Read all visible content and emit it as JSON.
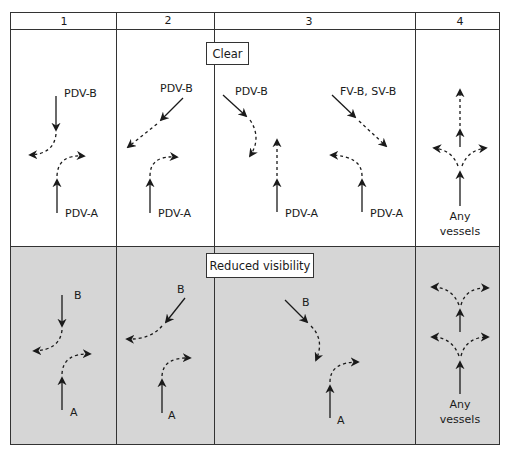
{
  "columns": [
    {
      "id": 1,
      "label": "1"
    },
    {
      "id": 2,
      "label": "2"
    },
    {
      "id": 3,
      "label": "3"
    },
    {
      "id": 4,
      "label": "4"
    }
  ],
  "rows": [
    {
      "name": "clear",
      "label": "Clear",
      "fill": "#ffffff"
    },
    {
      "name": "reduced-visibility",
      "label": "Reduced visibility",
      "fill": "#d6d6d6"
    }
  ],
  "clear": {
    "col1": {
      "top_vessel": "PDV-B",
      "bottom_vessel": "PDV-A"
    },
    "col2": {
      "top_vessel": "PDV-B",
      "bottom_vessel": "PDV-A"
    },
    "col3": {
      "left_top_vessel": "PDV-B",
      "left_bottom_vessel": "PDV-A",
      "right_top_vessel": "FV-B, SV-B",
      "right_bottom_vessel": "PDV-A"
    },
    "col4": {
      "vessel_line1": "Any",
      "vessel_line2": "vessels"
    }
  },
  "reduced": {
    "col1": {
      "top_vessel": "B",
      "bottom_vessel": "A"
    },
    "col2": {
      "top_vessel": "B",
      "bottom_vessel": "A"
    },
    "col3": {
      "top_vessel": "B",
      "bottom_vessel": "A"
    },
    "col4": {
      "vessel_line1": "Any",
      "vessel_line2": "vessels"
    }
  },
  "colors": {
    "line": "#1a1a1a",
    "grid": "#333333",
    "shade": "#d6d6d6",
    "background": "#ffffff"
  }
}
